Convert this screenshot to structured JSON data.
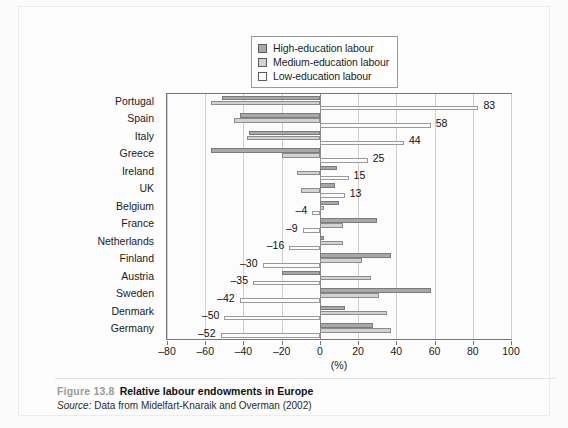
{
  "figure": {
    "number": "Figure 13.8",
    "title": "Relative labour endowments in Europe",
    "source_word": "Source:",
    "source_text": "Data from Midelfart-Knaraik and Overman (2002)"
  },
  "legend": {
    "items": [
      {
        "label": "High-education labour",
        "color": "#a8a8a8"
      },
      {
        "label": "Medium-education labour",
        "color": "#d2d2d2"
      },
      {
        "label": "Low-education labour",
        "color": "#fbfbfb"
      }
    ]
  },
  "chart_data": {
    "type": "bar",
    "orientation": "horizontal",
    "title": "Relative labour endowments in Europe",
    "xlabel": "(%)",
    "ylabel": "",
    "xlim": [
      -80,
      100
    ],
    "xticks": [
      -80,
      -60,
      -40,
      -20,
      0,
      20,
      40,
      60,
      80,
      100
    ],
    "xtick_labels": [
      "-80",
      "-60",
      "-40",
      "-20",
      "0",
      "20",
      "40",
      "60",
      "80",
      "100"
    ],
    "grid": true,
    "legend_position": "top-center",
    "categories": [
      "Portugal",
      "Spain",
      "Italy",
      "Greece",
      "Ireland",
      "UK",
      "Belgium",
      "France",
      "Netherlands",
      "Finland",
      "Austria",
      "Sweden",
      "Denmark",
      "Germany"
    ],
    "series": [
      {
        "name": "High-education labour",
        "color": "#a8a8a8",
        "values": [
          -51,
          -42,
          -37,
          -57,
          9,
          8,
          10,
          30,
          2,
          37,
          -20,
          58,
          13,
          28
        ]
      },
      {
        "name": "Medium-education labour",
        "color": "#d2d2d2",
        "values": [
          -57,
          -45,
          -38,
          -20,
          -12,
          -10,
          2,
          12,
          12,
          22,
          27,
          31,
          35,
          37
        ]
      },
      {
        "name": "Low-education labour",
        "color": "#fbfbfb",
        "values": [
          83,
          58,
          44,
          25,
          15,
          13,
          -4,
          -9,
          -16,
          -30,
          -35,
          -42,
          -50,
          -52
        ]
      }
    ],
    "annotations": [
      {
        "category": "Portugal",
        "series": "Low-education labour",
        "value": 83,
        "text": "83",
        "side": "right"
      },
      {
        "category": "Spain",
        "series": "Low-education labour",
        "value": 58,
        "text": "58",
        "side": "right"
      },
      {
        "category": "Italy",
        "series": "Low-education labour",
        "value": 44,
        "text": "44",
        "side": "right"
      },
      {
        "category": "Greece",
        "series": "Low-education labour",
        "value": 25,
        "text": "25",
        "side": "right"
      },
      {
        "category": "Ireland",
        "series": "Low-education labour",
        "value": 15,
        "text": "15",
        "side": "right"
      },
      {
        "category": "UK",
        "series": "Low-education labour",
        "value": 13,
        "text": "13",
        "side": "right"
      },
      {
        "category": "Belgium",
        "series": "Low-education labour",
        "value": -4,
        "text": "-4",
        "side": "left"
      },
      {
        "category": "France",
        "series": "Low-education labour",
        "value": -9,
        "text": "-9",
        "side": "left"
      },
      {
        "category": "Netherlands",
        "series": "Low-education labour",
        "value": -16,
        "text": "-16",
        "side": "left"
      },
      {
        "category": "Finland",
        "series": "Low-education labour",
        "value": -30,
        "text": "-30",
        "side": "left"
      },
      {
        "category": "Austria",
        "series": "Low-education labour",
        "value": -35,
        "text": "-35",
        "side": "left"
      },
      {
        "category": "Sweden",
        "series": "Low-education labour",
        "value": -42,
        "text": "-42",
        "side": "left"
      },
      {
        "category": "Denmark",
        "series": "Low-education labour",
        "value": -50,
        "text": "-50",
        "side": "left"
      },
      {
        "category": "Germany",
        "series": "Low-education labour",
        "value": -52,
        "text": "-52",
        "side": "left"
      }
    ]
  }
}
